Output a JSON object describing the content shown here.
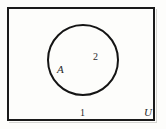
{
  "figure": {
    "type": "venn-diagram",
    "background_color": "#fdfdfb",
    "line_color": "#1a1a1a"
  },
  "universe": {
    "label": "U",
    "shape": "rectangle"
  },
  "sets": [
    {
      "label": "A",
      "shape": "circle"
    }
  ],
  "regions": [
    {
      "number": "1",
      "description": "outside circle A, inside U"
    },
    {
      "number": "2",
      "description": "inside circle A"
    }
  ]
}
